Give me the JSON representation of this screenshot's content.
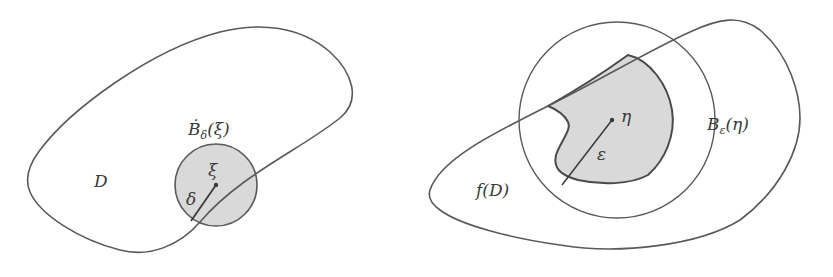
{
  "colors": {
    "stroke": "#5a5a5a",
    "shade": "#d9d9d9",
    "text": "#3a3a3a",
    "background": "#ffffff"
  },
  "left_panel": {
    "region_label": "D",
    "ball_label": {
      "base": "Ḃ",
      "subscript": "δ",
      "arg": "(ξ)"
    },
    "center_label": "ξ",
    "radius_label": "δ"
  },
  "right_panel": {
    "region_label": "f(D)",
    "ball_label": {
      "base": "B",
      "subscript": "ε",
      "arg": "(η)"
    },
    "center_label": "η",
    "radius_label": "ε"
  }
}
